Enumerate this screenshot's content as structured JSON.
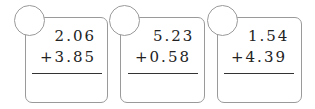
{
  "problems": [
    {
      "top": "2.06",
      "bottom": "+3.85",
      "operator": "+",
      "answer": ""
    },
    {
      "top": "5.23",
      "bottom": "+0.58",
      "operator": "+",
      "answer": ""
    },
    {
      "top": "1.54",
      "bottom": "+4.39",
      "operator": "+",
      "answer": ""
    }
  ]
}
